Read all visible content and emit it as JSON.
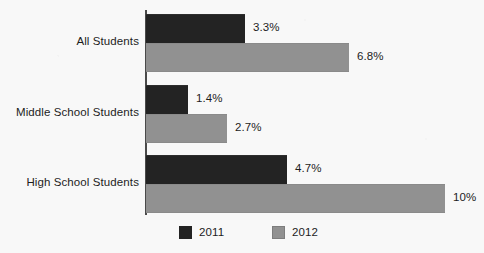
{
  "chart_data": {
    "type": "bar",
    "orientation": "horizontal",
    "title": "",
    "subtitle": "",
    "xlabel": "",
    "ylabel": "",
    "grid": false,
    "legend_position": "bottom",
    "axis_max_percent": 10,
    "px_per_percent": 29.9,
    "categories": [
      "All Students",
      "Middle School Students",
      "High School Students"
    ],
    "series": [
      {
        "name": "2011",
        "color": "#232323",
        "values": [
          3.3,
          1.4,
          4.7
        ],
        "labels": [
          "3.3%",
          "1.4%",
          "4.7%"
        ]
      },
      {
        "name": "2012",
        "color": "#919191",
        "values": [
          6.8,
          2.7,
          10
        ],
        "labels": [
          "6.8%",
          "2.7%",
          "10%"
        ]
      }
    ]
  },
  "legend": {
    "items": [
      {
        "label": "2011",
        "color": "#232323",
        "swatch": "legend-swatch-2011"
      },
      {
        "label": "2012",
        "color": "#919191",
        "swatch": "legend-swatch-2012"
      }
    ]
  },
  "colors": {
    "background": "#f8f8f8",
    "axis": "#4a4a4a",
    "text": "#1d1d1d",
    "series_2011": "#232323",
    "series_2012": "#919191"
  }
}
